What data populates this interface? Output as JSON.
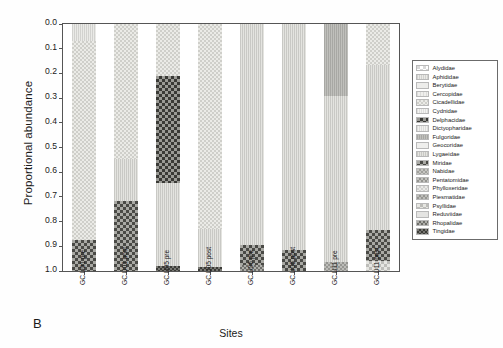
{
  "panel": {
    "letter": "B"
  },
  "chart_data": {
    "type": "bar",
    "subtype": "stacked-proportional",
    "title": "",
    "xlabel": "Sites",
    "ylabel": "Proportional abundance",
    "ylim": [
      0.0,
      1.0
    ],
    "y_axis_inverted": true,
    "grid": false,
    "legend_position": "right",
    "y_ticks": [
      "0.0",
      "0.1",
      "0.2",
      "0.3",
      "0.4",
      "0.5",
      "0.6",
      "0.7",
      "0.8",
      "0.9",
      "1.0"
    ],
    "categories": [
      "GC U01 pre",
      "GC U01 post",
      "GC U05 pre",
      "GC U05 post",
      "GC U06 pre",
      "GC U06 post",
      "GC U11 pre",
      "GC U11 post"
    ],
    "legend_entries": [
      "Alydidae",
      "Aphididae",
      "Berytidae",
      "Cercopidae",
      "Cicadellidae",
      "Cydnidae",
      "Delphacidae",
      "Dictyopharidae",
      "Fulgoridae",
      "Geocoridae",
      "Lygaeidae",
      "Miridae",
      "Nabidae",
      "Pentatomidae",
      "Phylloxeridae",
      "Piesmatidae",
      "Psyllidae",
      "Reduviidae",
      "Rhopalidae",
      "Tingidae"
    ],
    "series": [
      {
        "name": "Alydidae",
        "values": [
          0.0,
          0.0,
          0.0,
          0.0,
          0.0,
          0.0,
          0.0,
          0.0
        ]
      },
      {
        "name": "Aphididae",
        "values": [
          0.07,
          0.0,
          0.0,
          0.0,
          0.0,
          0.0,
          0.0,
          0.0
        ]
      },
      {
        "name": "Berytidae",
        "values": [
          0.0,
          0.0,
          0.0,
          0.0,
          0.0,
          0.0,
          0.0,
          0.0
        ]
      },
      {
        "name": "Cercopidae",
        "values": [
          0.0,
          0.0,
          0.0,
          0.0,
          0.0,
          0.0,
          0.0,
          0.0
        ]
      },
      {
        "name": "Cicadellidae",
        "values": [
          0.805,
          0.545,
          0.21,
          0.83,
          0.0,
          0.0,
          0.0,
          0.165
        ]
      },
      {
        "name": "Cydnidae",
        "values": [
          0.0,
          0.0,
          0.0,
          0.0,
          0.0,
          0.0,
          0.0,
          0.0
        ]
      },
      {
        "name": "Delphacidae",
        "values": [
          0.0,
          0.0,
          0.435,
          0.0,
          0.0,
          0.0,
          0.0,
          0.0
        ]
      },
      {
        "name": "Dictyopharidae",
        "values": [
          0.0,
          0.0,
          0.0,
          0.0,
          0.0,
          0.0,
          0.0,
          0.0
        ]
      },
      {
        "name": "Fulgoridae",
        "values": [
          0.0,
          0.0,
          0.0,
          0.0,
          0.0,
          0.0,
          0.29,
          0.0
        ]
      },
      {
        "name": "Geocoridae",
        "values": [
          0.0,
          0.0,
          0.0,
          0.0,
          0.0,
          0.0,
          0.0,
          0.0
        ]
      },
      {
        "name": "Lygaeidae",
        "values": [
          0.0,
          0.17,
          0.335,
          0.155,
          0.895,
          0.915,
          0.675,
          0.67
        ]
      },
      {
        "name": "Miridae",
        "values": [
          0.125,
          0.285,
          0.0,
          0.0,
          0.08,
          0.085,
          0.0,
          0.125
        ]
      },
      {
        "name": "Nabidae",
        "values": [
          0.0,
          0.0,
          0.0,
          0.0,
          0.0,
          0.0,
          0.0,
          0.0
        ]
      },
      {
        "name": "Pentatomidae",
        "values": [
          0.0,
          0.0,
          0.0,
          0.0,
          0.0,
          0.0,
          0.0,
          0.0
        ]
      },
      {
        "name": "Phylloxeridae",
        "values": [
          0.0,
          0.0,
          0.0,
          0.0,
          0.0,
          0.0,
          0.0,
          0.0
        ]
      },
      {
        "name": "Piesmatidae",
        "values": [
          0.0,
          0.0,
          0.0,
          0.0,
          0.0,
          0.0,
          0.035,
          0.0
        ]
      },
      {
        "name": "Psyllidae",
        "values": [
          0.0,
          0.0,
          0.0,
          0.0,
          0.0,
          0.0,
          0.0,
          0.04
        ]
      },
      {
        "name": "Reduviidae",
        "values": [
          0.0,
          0.0,
          0.0,
          0.0,
          0.0,
          0.0,
          0.0,
          0.0
        ]
      },
      {
        "name": "Rhopalidae",
        "values": [
          0.0,
          0.0,
          0.0,
          0.0,
          0.025,
          0.0,
          0.0,
          0.0
        ]
      },
      {
        "name": "Tingidae",
        "values": [
          0.0,
          0.0,
          0.02,
          0.015,
          0.0,
          0.0,
          0.0,
          0.0
        ]
      }
    ]
  }
}
